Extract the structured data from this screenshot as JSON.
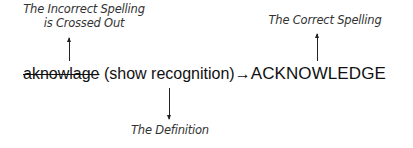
{
  "annotations": {
    "incorrect_label_line1": "The Incorrect Spelling",
    "incorrect_label_line2": "is Crossed Out",
    "correct_label": "The Correct Spelling",
    "definition_label": "The Definition"
  },
  "entry": {
    "incorrect_spelling": "aknowlage",
    "definition": "(show recognition)",
    "arrow": "→",
    "correct_spelling": "ACKNOWLEDGE"
  }
}
